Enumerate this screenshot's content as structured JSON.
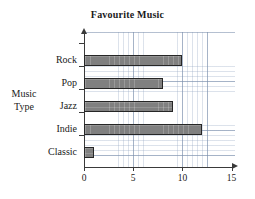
{
  "chart_data": {
    "type": "bar",
    "orientation": "horizontal",
    "title": "Favourite Music",
    "xlabel": "",
    "ylabel": "Music Type",
    "ylabel_lines": [
      "Music",
      "Type"
    ],
    "categories": [
      "Rock",
      "Pop",
      "Jazz",
      "Indie",
      "Classic"
    ],
    "values": [
      10,
      8,
      9,
      12,
      1
    ],
    "xlim": [
      0,
      15
    ],
    "xticks": [
      0,
      5,
      10,
      15
    ],
    "xtick_labels": [
      "0",
      "5",
      "10",
      "15"
    ],
    "grid": true,
    "grid_style": "graph-paper",
    "legend": null,
    "bar_color": "#808080",
    "bar_edge_color": "#262626",
    "grid_color": "#8aa0be",
    "axis_color": "#3a3a3a",
    "bars": [
      {
        "category": "Rock",
        "value": 10
      },
      {
        "category": "Pop",
        "value": 8
      },
      {
        "category": "Jazz",
        "value": 9
      },
      {
        "category": "Indie",
        "value": 12
      },
      {
        "category": "Classic",
        "value": 1
      }
    ]
  }
}
